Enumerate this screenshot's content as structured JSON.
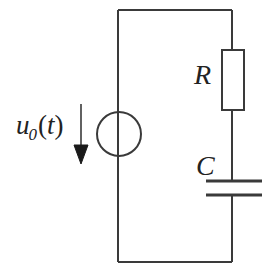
{
  "diagram": {
    "type": "electrical-circuit-schematic",
    "background_color": "#ffffff",
    "line_color": "#3a3a3a",
    "label_color": "#222222",
    "line_width": 2
  },
  "labels": {
    "source_variable": "u",
    "source_subscript": "0",
    "source_argument_open": "(",
    "source_argument": "t",
    "source_argument_close": ")",
    "source_full": "u0(t)",
    "resistor": "R",
    "capacitor": "C"
  },
  "components": {
    "voltage_source": {
      "name": "voltage-source",
      "symbol": "circle",
      "center_x": 119,
      "center_y": 134,
      "radius": 22
    },
    "resistor": {
      "name": "resistor",
      "symbol": "rectangle",
      "x": 222,
      "y": 50,
      "width": 22,
      "height": 60
    },
    "capacitor": {
      "name": "capacitor",
      "symbol": "parallel-plates",
      "plate_left_x": 206,
      "plate_right_x": 262,
      "top_plate_y": 181,
      "bottom_plate_y": 195,
      "plate_thickness": 3
    },
    "arrow": {
      "name": "voltage-direction-arrow",
      "direction": "down",
      "x": 81,
      "shaft_top_y": 104,
      "shaft_bottom_y": 146,
      "head_tip_y": 164,
      "head_half_width": 7
    }
  },
  "wires": {
    "loop_left_x": 118,
    "loop_right_x": 232,
    "loop_top_y": 10,
    "loop_bottom_y": 262
  }
}
